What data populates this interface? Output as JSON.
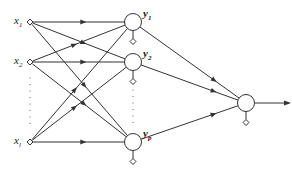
{
  "diagram": {
    "type": "neural-network",
    "stroke_color": "#333333",
    "background": "#ffffff",
    "inputs": [
      {
        "id": "x1",
        "base": "x",
        "sub": "1",
        "x": 30,
        "y": 22
      },
      {
        "id": "x2",
        "base": "x",
        "sub": "2",
        "x": 30,
        "y": 62
      },
      {
        "id": "xl",
        "base": "x",
        "sub": "l",
        "x": 30,
        "y": 142
      }
    ],
    "hidden": [
      {
        "id": "y1",
        "base": "y",
        "sub": "1",
        "x": 133,
        "y": 22
      },
      {
        "id": "y2",
        "base": "y",
        "sub": "2",
        "x": 133,
        "y": 62
      },
      {
        "id": "yp",
        "base": "y",
        "sub": "p",
        "x": 133,
        "y": 142
      }
    ],
    "output": {
      "id": "out",
      "x": 246,
      "y": 103
    },
    "ellipsis": {
      "inputs": "⋮",
      "hidden": "⋮"
    },
    "connections": "fully-connected: every input → every hidden neuron; every hidden neuron → output neuron",
    "bias_terminals": "small open diamond below each hidden and output neuron"
  }
}
